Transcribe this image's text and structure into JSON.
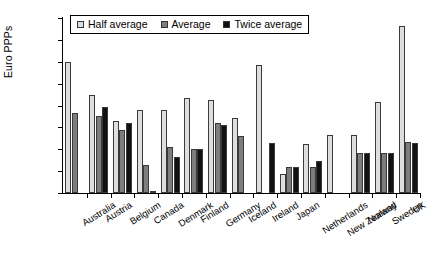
{
  "chart_data": {
    "type": "bar",
    "title": "",
    "xlabel": "",
    "ylabel": "Euro PPPs",
    "ylim": [
      0,
      800
    ],
    "ytick_values": [
      0,
      100,
      200,
      300,
      400,
      500,
      600,
      700,
      800
    ],
    "ytick_labels": [
      "0",
      "100",
      "200",
      "300",
      "400",
      "500",
      "600",
      "700",
      "800"
    ],
    "grid": false,
    "legend_position": "top-left-inside",
    "categories": [
      "Australia",
      "Austria",
      "Belgium",
      "Canada",
      "Denmark",
      "Finland",
      "Germany",
      "Iceland",
      "Ireland",
      "Japan",
      "Netherlands",
      "New Zealand",
      "Norway",
      "Sweden",
      "UK"
    ],
    "series": [
      {
        "name": "Half average",
        "color": "#dedede",
        "values": [
          600,
          447,
          328,
          378,
          378,
          435,
          423,
          345,
          583,
          85,
          225,
          265,
          265,
          415,
          765
        ]
      },
      {
        "name": "Average",
        "color": "#7d7d7d",
        "values": [
          368,
          352,
          290,
          128,
          210,
          200,
          318,
          260,
          0,
          120,
          120,
          0,
          185,
          185,
          232
        ]
      },
      {
        "name": "Twice average",
        "color": "#111111",
        "values": [
          0,
          392,
          320,
          5,
          165,
          200,
          310,
          0,
          228,
          120,
          148,
          0,
          185,
          185,
          228
        ]
      }
    ]
  },
  "legend": {
    "items": [
      {
        "label": "Half average",
        "swatch": "half-average-swatch"
      },
      {
        "label": "Average",
        "swatch": "average-swatch"
      },
      {
        "label": "Twice average",
        "swatch": "twice-average-swatch"
      }
    ]
  }
}
